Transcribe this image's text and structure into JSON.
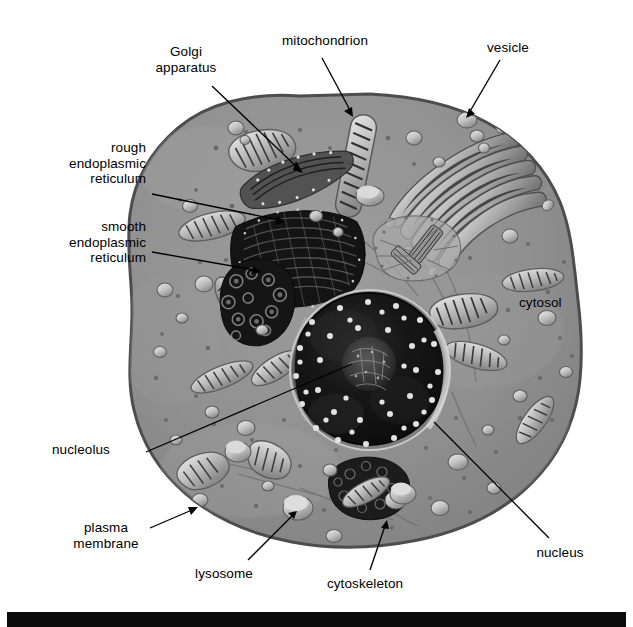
{
  "figure": {
    "type": "labeled-biological-diagram"
  },
  "colors": {
    "background": "#ffffff",
    "cytosol": "#8e8e8e",
    "cytosol_light": "#9a9a9a",
    "membrane_outline": "#4a4a4a",
    "nucleus_dark": "#141414",
    "nucleus_rim": "#b9b9b9",
    "rough_er": "#1b1b1b",
    "golgi": "#b5b5b5",
    "mitochondrion": "#c9c9c9",
    "vesicle": "#d6d6d6",
    "leader_line": "#000000",
    "label_text": "#000000",
    "footer_bar": "#0b0b0b"
  },
  "labels": [
    {
      "id": "golgi",
      "text": "Golgi\napparatus",
      "name": "golgi-apparatus"
    },
    {
      "id": "mitochondrion",
      "text": "mitochondrion",
      "name": "mitochondrion"
    },
    {
      "id": "vesicle",
      "text": "vesicle",
      "name": "vesicle"
    },
    {
      "id": "rough_er",
      "text": "rough\nendoplasmic\nreticulum",
      "name": "rough-endoplasmic-reticulum"
    },
    {
      "id": "smooth_er",
      "text": "smooth\nendoplasmic\nreticulum",
      "name": "smooth-endoplasmic-reticulum"
    },
    {
      "id": "cytosol",
      "text": "cytosol",
      "name": "cytosol"
    },
    {
      "id": "nucleolus",
      "text": "nucleolus",
      "name": "nucleolus"
    },
    {
      "id": "plasma_membrane",
      "text": "plasma\nmembrane",
      "name": "plasma-membrane"
    },
    {
      "id": "lysosome",
      "text": "lysosome",
      "name": "lysosome"
    },
    {
      "id": "cytoskeleton",
      "text": "cytoskeleton",
      "name": "cytoskeleton"
    },
    {
      "id": "nucleus",
      "text": "nucleus",
      "name": "nucleus"
    }
  ],
  "label_text": {
    "golgi": "Golgi\napparatus",
    "mitochondrion": "mitochondrion",
    "vesicle": "vesicle",
    "rough_er": "rough\nendoplasmic\nreticulum",
    "smooth_er": "smooth\nendoplasmic\nreticulum",
    "cytosol": "cytosol",
    "nucleolus": "nucleolus",
    "plasma_membrane": "plasma\nmembrane",
    "lysosome": "lysosome",
    "cytoskeleton": "cytoskeleton",
    "nucleus": "nucleus"
  },
  "leader_lines": [
    {
      "id": "golgi",
      "from": [
        212,
        86
      ],
      "to": [
        302,
        172
      ],
      "arrow": true,
      "name": "leader-golgi"
    },
    {
      "id": "mitochondrion",
      "from": [
        322,
        58
      ],
      "to": [
        352,
        116
      ],
      "arrow": true,
      "name": "leader-mitochondrion"
    },
    {
      "id": "vesicle",
      "from": [
        500,
        60
      ],
      "to": [
        466,
        117
      ],
      "arrow": true,
      "name": "leader-vesicle"
    },
    {
      "id": "rough_er",
      "from": [
        152,
        194
      ],
      "to": [
        284,
        222
      ],
      "arrow": true,
      "name": "leader-rough-er"
    },
    {
      "id": "smooth_er",
      "from": [
        152,
        252
      ],
      "to": [
        260,
        272
      ],
      "arrow": true,
      "name": "leader-smooth-er"
    },
    {
      "id": "nucleolus",
      "from": [
        148,
        452
      ],
      "to": [
        330,
        372
      ],
      "arrow": false,
      "name": "leader-nucleolus"
    },
    {
      "id": "plasma_membrane",
      "from": [
        148,
        528
      ],
      "to": [
        196,
        508
      ],
      "arrow": true,
      "name": "leader-plasma-membrane"
    },
    {
      "id": "lysosome",
      "from": [
        248,
        560
      ],
      "to": [
        296,
        512
      ],
      "arrow": true,
      "name": "leader-lysosome"
    },
    {
      "id": "cytoskeleton",
      "from": [
        370,
        570
      ],
      "to": [
        387,
        522
      ],
      "arrow": true,
      "name": "leader-cytoskeleton"
    },
    {
      "id": "nucleus",
      "from": [
        549,
        538
      ],
      "to": [
        432,
        424
      ],
      "arrow": false,
      "name": "leader-nucleus"
    }
  ],
  "organelles": {
    "nucleus": {
      "cx": 370,
      "cy": 370,
      "r": 78,
      "pores": 42
    },
    "mitochondria_count": 13,
    "vesicles_count": 34,
    "golgi_stacks": 2,
    "ribosome_dots": 60
  },
  "footer": {
    "bar_color": "#0b0b0b",
    "caption": ""
  }
}
